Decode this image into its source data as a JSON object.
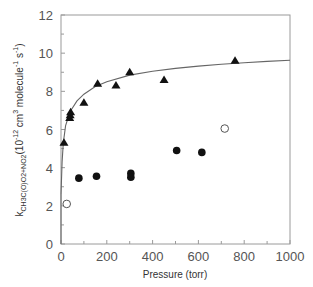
{
  "chart_data": {
    "type": "scatter",
    "title": "",
    "xlabel": "Pressure (torr)",
    "ylabel": "k_{CH3C(O)O2+NO2} (10^-12 cm^3 molecule^-1 s^-1)",
    "ylabel_parts": {
      "k": "k",
      "subscript": "CH3C(O)O2+NO2",
      "units": "(10",
      "exp1": "-12",
      "units2": " cm",
      "exp2": "3",
      "units3": " molecule",
      "exp3": "-1",
      "units4": " s",
      "exp4": "-1",
      "close": ")"
    },
    "xlim": [
      0,
      1000
    ],
    "ylim": [
      0,
      12
    ],
    "xticks": [
      0,
      200,
      400,
      600,
      800,
      1000
    ],
    "yticks": [
      0,
      2,
      4,
      6,
      8,
      10,
      12
    ],
    "xtick_labels": [
      "0",
      "200",
      "400",
      "600",
      "800",
      "1000"
    ],
    "ytick_labels": [
      "0",
      "2",
      "4",
      "6",
      "8",
      "10",
      "12"
    ],
    "grid": false,
    "legend": null,
    "series": [
      {
        "name": "triangles",
        "marker": "filled-triangle",
        "points": [
          [
            13,
            5.3
          ],
          [
            38,
            6.6
          ],
          [
            40,
            6.75
          ],
          [
            42,
            6.9
          ],
          [
            100,
            7.4
          ],
          [
            160,
            8.4
          ],
          [
            240,
            8.3
          ],
          [
            300,
            9.0
          ],
          [
            450,
            8.6
          ],
          [
            760,
            9.6
          ]
        ]
      },
      {
        "name": "filled circles",
        "marker": "filled-circle",
        "points": [
          [
            78,
            3.45
          ],
          [
            155,
            3.55
          ],
          [
            305,
            3.7
          ],
          [
            305,
            3.5
          ],
          [
            505,
            4.9
          ],
          [
            615,
            4.8
          ]
        ]
      },
      {
        "name": "open circles",
        "marker": "open-circle",
        "points": [
          [
            25,
            2.1
          ],
          [
            715,
            6.05
          ]
        ]
      },
      {
        "name": "fit curve",
        "marker": "line",
        "points": [
          [
            0,
            2.6
          ],
          [
            5,
            4.3
          ],
          [
            10,
            5.3
          ],
          [
            20,
            6.2
          ],
          [
            40,
            6.95
          ],
          [
            70,
            7.5
          ],
          [
            100,
            7.85
          ],
          [
            150,
            8.25
          ],
          [
            200,
            8.5
          ],
          [
            300,
            8.85
          ],
          [
            400,
            9.05
          ],
          [
            500,
            9.2
          ],
          [
            600,
            9.32
          ],
          [
            700,
            9.42
          ],
          [
            800,
            9.5
          ],
          [
            900,
            9.57
          ],
          [
            1000,
            9.63
          ]
        ]
      }
    ]
  }
}
